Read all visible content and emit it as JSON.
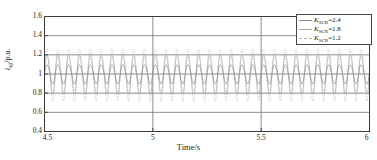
{
  "chart_data": {
    "type": "line",
    "title": "",
    "xlabel": "Time/s",
    "ylabel": "i_sg/p.u.",
    "ylabel_main": "i",
    "ylabel_sub": "sg",
    "ylabel_unit": "/p.u.",
    "xlim": [
      4.5,
      6
    ],
    "ylim": [
      0.4,
      1.6
    ],
    "xticks": [
      "4.5",
      "5",
      "5.5",
      "6"
    ],
    "xtick_values": [
      4.5,
      5,
      5.5,
      6
    ],
    "yticks": [
      "0.4",
      "0.6",
      "0.8",
      "1",
      "1.2",
      "1.4",
      "1.6"
    ],
    "ytick_values": [
      0.4,
      0.6,
      0.8,
      1.0,
      1.2,
      1.4,
      1.6
    ],
    "grid": "horizontal-and-vertical-at-major-ticks",
    "legend_position": "top-right",
    "oscillation_frequency_hz": 20,
    "series": [
      {
        "name": "K_SCR=2.4",
        "label_main": "K",
        "label_sub": "SCR",
        "label_value": "=2.4",
        "color": "#8a8a8a",
        "dash": "solid",
        "mean": 1.0,
        "amplitude": 0.1,
        "description": "smallest amplitude oscillation, ranges 0.90 to 1.10 p.u."
      },
      {
        "name": "K_SCR=1.8",
        "label_main": "K",
        "label_sub": "SCR",
        "label_value": "=1.8",
        "color": "#a8a8a8",
        "dash": "solid-light",
        "mean": 1.0,
        "amplitude": 0.2,
        "description": "medium amplitude oscillation, ranges 0.80 to 1.20 p.u."
      },
      {
        "name": "K_SCR=1.2",
        "label_main": "K",
        "label_sub": "SCR",
        "label_value": "=1.2",
        "color": "#b5b5b5",
        "dash": "dashed",
        "mean": 1.0,
        "amplitude": 0.27,
        "description": "largest amplitude oscillation, ranges 0.73 to 1.27 p.u."
      }
    ]
  }
}
